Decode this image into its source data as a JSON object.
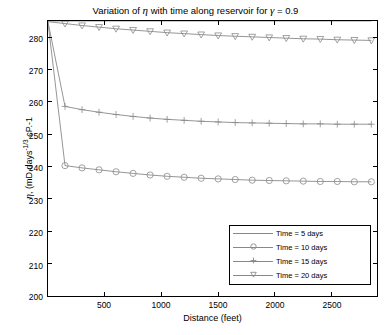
{
  "chart_data": {
    "type": "line",
    "title_prefix": "Variation of ",
    "title_eta": "η",
    "title_mid": " with time along reservoir for ",
    "title_gamma": "γ",
    "title_suffix": " = 0.9",
    "title_full": "Variation of η with time along reservoir for γ = 0.9",
    "xlabel": "Distance (feet)",
    "ylabel_symbol": "η",
    "ylabel_units": ", (mD.days^1/3 cP.-1",
    "ylabel_full": "η, (mD.days⁻¹⁄³ cP.-1",
    "xlim": [
      0,
      2900
    ],
    "ylim": [
      200,
      285
    ],
    "xticks": [
      500,
      1000,
      1500,
      2000,
      2500
    ],
    "yticks": [
      200,
      210,
      220,
      230,
      240,
      250,
      260,
      270,
      280
    ],
    "grid": false,
    "legend_position": "lower right",
    "series": [
      {
        "name": "Time = 5 days",
        "label": "Time = 5 days",
        "marker": "none",
        "color": "#8a8a8a",
        "x": [
          0,
          150,
          300,
          450,
          600,
          750,
          900,
          1050,
          1200,
          1350,
          1500,
          1650,
          1800,
          1950,
          2100,
          2250,
          2400,
          2550,
          2700,
          2850
        ],
        "y": [
          285,
          285,
          285,
          285,
          285,
          285,
          285,
          285,
          285,
          285,
          285,
          285,
          285,
          285,
          285,
          285,
          285,
          285,
          285,
          285
        ]
      },
      {
        "name": "Time = 10 days",
        "label": "Time = 10 days",
        "marker": "circle",
        "color": "#8a8a8a",
        "x": [
          0,
          150,
          300,
          450,
          600,
          750,
          900,
          1050,
          1200,
          1350,
          1500,
          1650,
          1800,
          1950,
          2100,
          2250,
          2400,
          2550,
          2700,
          2850
        ],
        "y": [
          284.5,
          240.3,
          239.6,
          239.0,
          238.4,
          237.9,
          237.4,
          237.0,
          236.7,
          236.4,
          236.2,
          236.0,
          235.8,
          235.7,
          235.6,
          235.5,
          235.4,
          235.4,
          235.3,
          235.3
        ]
      },
      {
        "name": "Time = 15 days",
        "label": "Time = 15 days",
        "marker": "plus",
        "color": "#8a8a8a",
        "x": [
          0,
          150,
          300,
          450,
          600,
          750,
          900,
          1050,
          1200,
          1350,
          1500,
          1650,
          1800,
          1950,
          2100,
          2250,
          2400,
          2550,
          2700,
          2850
        ],
        "y": [
          284.7,
          258.6,
          257.6,
          256.8,
          256.1,
          255.5,
          255.0,
          254.6,
          254.3,
          254.0,
          253.8,
          253.6,
          253.5,
          253.4,
          253.3,
          253.2,
          253.2,
          253.1,
          253.1,
          253.1
        ]
      },
      {
        "name": "Time = 20 days",
        "label": "Time = 20 days",
        "marker": "triangle-down",
        "color": "#8a8a8a",
        "x": [
          0,
          150,
          300,
          450,
          600,
          750,
          900,
          1050,
          1200,
          1350,
          1500,
          1650,
          1800,
          1950,
          2100,
          2250,
          2400,
          2550,
          2700,
          2850
        ],
        "y": [
          284.8,
          284.2,
          283.6,
          283.1,
          282.6,
          282.2,
          281.8,
          281.4,
          281.1,
          280.8,
          280.5,
          280.3,
          280.1,
          279.9,
          279.7,
          279.5,
          279.4,
          279.2,
          279.1,
          279.0
        ]
      }
    ]
  }
}
